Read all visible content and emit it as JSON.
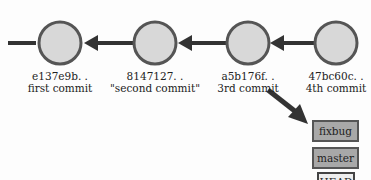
{
  "commits": [
    {
      "hash": "e137e9b. .",
      "message": "first commit"
    },
    {
      "hash": "8147127. .",
      "message": "\"second commit\""
    },
    {
      "hash": "a5b176f. .",
      "message": "3rd commit"
    },
    {
      "hash": "47bc60c. .",
      "message": "4th commit"
    }
  ],
  "refs": {
    "fixbug": "fixbug",
    "master": "master",
    "head": "HEAD"
  },
  "colors": {
    "node_fill": "#d8d8d8",
    "node_stroke": "#555555",
    "arrow": "#333333",
    "branch_fill": "#a8a8a8",
    "head_fill": "#eeeeee"
  }
}
